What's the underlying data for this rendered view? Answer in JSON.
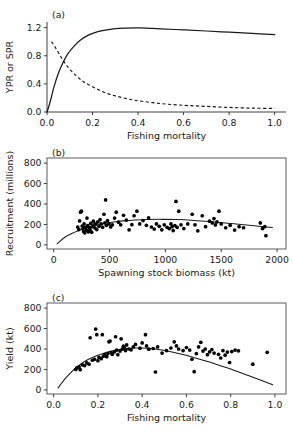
{
  "figure": {
    "panel_a_tag": "(a)",
    "panel_b_tag": "(b)",
    "panel_c_tag": "(c)"
  },
  "chart_data": [
    {
      "type": "line",
      "panel": "(a)",
      "title": "",
      "xlabel": "Fishing mortality",
      "ylabel": "YPR or SPR",
      "xlim": [
        0.0,
        1.05
      ],
      "ylim": [
        0.0,
        1.28
      ],
      "xticks": [
        0.0,
        0.2,
        0.4,
        0.6,
        0.8,
        1.0
      ],
      "xtick_labels": [
        "0.0",
        "0.2",
        "0.4",
        "0.6",
        "0.8",
        "1.0"
      ],
      "yticks": [
        0.0,
        0.4,
        0.8,
        1.2
      ],
      "ytick_labels": [
        "0.0",
        "0.4",
        "0.8",
        "1.2"
      ],
      "grid": false,
      "legend": "none",
      "frame": "left-bottom",
      "series": [
        {
          "name": "YPR",
          "style": "solid",
          "x": [
            0.0,
            0.01,
            0.02,
            0.03,
            0.05,
            0.07,
            0.09,
            0.12,
            0.15,
            0.18,
            0.21,
            0.25,
            0.3,
            0.35,
            0.4,
            0.45,
            0.5,
            0.6,
            0.7,
            0.8,
            0.9,
            1.0
          ],
          "y": [
            0.0,
            0.1,
            0.22,
            0.35,
            0.55,
            0.7,
            0.82,
            0.94,
            1.03,
            1.09,
            1.13,
            1.16,
            1.185,
            1.193,
            1.195,
            1.19,
            1.183,
            1.168,
            1.152,
            1.135,
            1.118,
            1.1
          ]
        },
        {
          "name": "SPR",
          "style": "dashed",
          "x": [
            0.02,
            0.04,
            0.06,
            0.08,
            0.1,
            0.13,
            0.16,
            0.2,
            0.25,
            0.3,
            0.35,
            0.4,
            0.5,
            0.6,
            0.7,
            0.8,
            0.9,
            1.0
          ],
          "y": [
            1.0,
            0.9,
            0.79,
            0.69,
            0.61,
            0.51,
            0.43,
            0.36,
            0.28,
            0.23,
            0.19,
            0.16,
            0.12,
            0.095,
            0.08,
            0.065,
            0.055,
            0.05
          ]
        }
      ]
    },
    {
      "type": "scatter",
      "panel": "(b)",
      "title": "",
      "xlabel": "Spawning stock biomass (kt)",
      "ylabel": "Recruitment (millions)",
      "xlim": [
        -60,
        2080
      ],
      "ylim": [
        -40,
        850
      ],
      "xticks": [
        0,
        500,
        1000,
        1500,
        2000
      ],
      "xtick_labels": [
        "0",
        "500",
        "1000",
        "1500",
        "2000"
      ],
      "yticks": [
        0,
        200,
        400,
        600,
        800
      ],
      "ytick_labels": [
        "0",
        "200",
        "400",
        "600",
        "800"
      ],
      "grid": false,
      "legend": "none",
      "frame": "full",
      "points": [
        [
          215,
          175
        ],
        [
          225,
          150
        ],
        [
          232,
          235
        ],
        [
          240,
          320
        ],
        [
          248,
          330
        ],
        [
          255,
          185
        ],
        [
          262,
          160
        ],
        [
          268,
          130
        ],
        [
          272,
          205
        ],
        [
          278,
          118
        ],
        [
          285,
          172
        ],
        [
          292,
          145
        ],
        [
          298,
          262
        ],
        [
          305,
          190
        ],
        [
          310,
          128
        ],
        [
          318,
          168
        ],
        [
          325,
          152
        ],
        [
          332,
          210
        ],
        [
          340,
          125
        ],
        [
          348,
          178
        ],
        [
          355,
          232
        ],
        [
          362,
          196
        ],
        [
          370,
          165
        ],
        [
          378,
          205
        ],
        [
          385,
          150
        ],
        [
          395,
          225
        ],
        [
          405,
          182
        ],
        [
          415,
          247
        ],
        [
          425,
          205
        ],
        [
          438,
          172
        ],
        [
          450,
          300
        ],
        [
          458,
          215
        ],
        [
          465,
          440
        ],
        [
          472,
          192
        ],
        [
          482,
          238
        ],
        [
          495,
          205
        ],
        [
          510,
          175
        ],
        [
          525,
          196
        ],
        [
          545,
          262
        ],
        [
          560,
          320
        ],
        [
          580,
          222
        ],
        [
          600,
          196
        ],
        [
          625,
          290
        ],
        [
          650,
          243
        ],
        [
          675,
          148
        ],
        [
          700,
          198
        ],
        [
          720,
          285
        ],
        [
          745,
          330
        ],
        [
          770,
          205
        ],
        [
          800,
          238
        ],
        [
          830,
          192
        ],
        [
          850,
          265
        ],
        [
          875,
          175
        ],
        [
          900,
          155
        ],
        [
          920,
          205
        ],
        [
          945,
          182
        ],
        [
          968,
          148
        ],
        [
          990,
          196
        ],
        [
          1015,
          172
        ],
        [
          1035,
          160
        ],
        [
          1050,
          205
        ],
        [
          1060,
          178
        ],
        [
          1070,
          140
        ],
        [
          1085,
          190
        ],
        [
          1095,
          425
        ],
        [
          1105,
          172
        ],
        [
          1120,
          330
        ],
        [
          1140,
          196
        ],
        [
          1165,
          160
        ],
        [
          1200,
          205
        ],
        [
          1240,
          300
        ],
        [
          1265,
          196
        ],
        [
          1290,
          138
        ],
        [
          1330,
          285
        ],
        [
          1360,
          178
        ],
        [
          1395,
          232
        ],
        [
          1420,
          215
        ],
        [
          1435,
          258
        ],
        [
          1448,
          195
        ],
        [
          1462,
          225
        ],
        [
          1480,
          330
        ],
        [
          1500,
          205
        ],
        [
          1540,
          168
        ],
        [
          1580,
          192
        ],
        [
          1620,
          145
        ],
        [
          1660,
          178
        ],
        [
          1700,
          168
        ],
        [
          1850,
          215
        ],
        [
          1870,
          160
        ],
        [
          1890,
          178
        ],
        [
          1900,
          90
        ]
      ],
      "fit_curve": {
        "name": "stock-recruitment fit",
        "x": [
          30,
          100,
          180,
          260,
          340,
          430,
          520,
          620,
          730,
          850,
          980,
          1100,
          1230,
          1360,
          1490,
          1620,
          1750,
          1880,
          1960
        ],
        "y": [
          10,
          75,
          120,
          155,
          182,
          205,
          222,
          235,
          244,
          249,
          250,
          248,
          242,
          232,
          220,
          206,
          192,
          178,
          170
        ]
      }
    },
    {
      "type": "scatter",
      "panel": "(c)",
      "title": "",
      "xlabel": "Fishing mortality",
      "ylabel": "Yield (kt)",
      "xlim": [
        -0.03,
        1.05
      ],
      "ylim": [
        -40,
        850
      ],
      "xticks": [
        0.0,
        0.2,
        0.4,
        0.6,
        0.8,
        1.0
      ],
      "xtick_labels": [
        "0.0",
        "0.2",
        "0.4",
        "0.6",
        "0.8",
        "1.0"
      ],
      "yticks": [
        0,
        200,
        400,
        600,
        800
      ],
      "ytick_labels": [
        "0",
        "200",
        "400",
        "600",
        "800"
      ],
      "grid": false,
      "legend": "none",
      "frame": "full",
      "points": [
        [
          0.1,
          200
        ],
        [
          0.105,
          215
        ],
        [
          0.115,
          225
        ],
        [
          0.12,
          198
        ],
        [
          0.13,
          245
        ],
        [
          0.14,
          238
        ],
        [
          0.15,
          265
        ],
        [
          0.16,
          252
        ],
        [
          0.165,
          510
        ],
        [
          0.175,
          290
        ],
        [
          0.185,
          300
        ],
        [
          0.19,
          595
        ],
        [
          0.195,
          540
        ],
        [
          0.2,
          285
        ],
        [
          0.205,
          318
        ],
        [
          0.215,
          305
        ],
        [
          0.22,
          540
        ],
        [
          0.225,
          330
        ],
        [
          0.23,
          345
        ],
        [
          0.24,
          325
        ],
        [
          0.245,
          355
        ],
        [
          0.25,
          470
        ],
        [
          0.255,
          478
        ],
        [
          0.26,
          365
        ],
        [
          0.265,
          348
        ],
        [
          0.275,
          372
        ],
        [
          0.28,
          520
        ],
        [
          0.285,
          390
        ],
        [
          0.29,
          345
        ],
        [
          0.3,
          380
        ],
        [
          0.305,
          500
        ],
        [
          0.31,
          398
        ],
        [
          0.315,
          428
        ],
        [
          0.32,
          410
        ],
        [
          0.325,
          385
        ],
        [
          0.33,
          440
        ],
        [
          0.34,
          400
        ],
        [
          0.35,
          392
        ],
        [
          0.36,
          420
        ],
        [
          0.37,
          445
        ],
        [
          0.39,
          408
        ],
        [
          0.4,
          460
        ],
        [
          0.415,
          540
        ],
        [
          0.42,
          430
        ],
        [
          0.43,
          398
        ],
        [
          0.45,
          405
        ],
        [
          0.46,
          175
        ],
        [
          0.47,
          420
        ],
        [
          0.49,
          360
        ],
        [
          0.51,
          385
        ],
        [
          0.53,
          410
        ],
        [
          0.545,
          470
        ],
        [
          0.555,
          430
        ],
        [
          0.565,
          400
        ],
        [
          0.585,
          385
        ],
        [
          0.6,
          415
        ],
        [
          0.615,
          390
        ],
        [
          0.625,
          300
        ],
        [
          0.635,
          178
        ],
        [
          0.645,
          355
        ],
        [
          0.655,
          420
        ],
        [
          0.665,
          465
        ],
        [
          0.675,
          380
        ],
        [
          0.685,
          400
        ],
        [
          0.695,
          345
        ],
        [
          0.705,
          372
        ],
        [
          0.715,
          395
        ],
        [
          0.725,
          360
        ],
        [
          0.745,
          348
        ],
        [
          0.755,
          312
        ],
        [
          0.765,
          385
        ],
        [
          0.775,
          340
        ],
        [
          0.785,
          370
        ],
        [
          0.795,
          268
        ],
        [
          0.805,
          375
        ],
        [
          0.82,
          390
        ],
        [
          0.835,
          382
        ],
        [
          0.9,
          252
        ],
        [
          0.965,
          368
        ]
      ],
      "fit_curve": {
        "name": "yield fit",
        "x": [
          0.02,
          0.05,
          0.08,
          0.11,
          0.14,
          0.17,
          0.2,
          0.24,
          0.28,
          0.32,
          0.36,
          0.4,
          0.44,
          0.48,
          0.52,
          0.58,
          0.64,
          0.7,
          0.76,
          0.82,
          0.88,
          0.94,
          0.99
        ],
        "y": [
          20,
          105,
          175,
          232,
          278,
          312,
          338,
          368,
          390,
          403,
          410,
          410,
          404,
          393,
          378,
          348,
          313,
          275,
          232,
          188,
          140,
          92,
          50
        ]
      }
    }
  ]
}
